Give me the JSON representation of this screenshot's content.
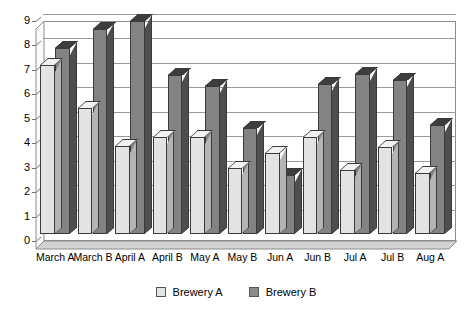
{
  "chart_data": {
    "type": "bar",
    "title": "",
    "subtitle": "",
    "xlabel": "",
    "ylabel": "",
    "ylim": [
      0,
      9
    ],
    "yticks": [
      0,
      1,
      2,
      3,
      4,
      5,
      6,
      7,
      8,
      9
    ],
    "grid": true,
    "legend_position": "bottom",
    "style": "3d-grouped-column",
    "categories": [
      "March A",
      "March B",
      "April A",
      "April B",
      "May A",
      "May B",
      "Jun A",
      "Jun B",
      "Jul A",
      "Jul B",
      "Aug A"
    ],
    "series": [
      {
        "name": "Brewery A",
        "color": "#e3e3e3",
        "values": [
          6.9,
          5.15,
          3.6,
          3.95,
          3.95,
          2.7,
          3.3,
          3.95,
          2.6,
          3.55,
          2.5
        ]
      },
      {
        "name": "Brewery B",
        "color": "#838383",
        "values": [
          7.6,
          8.4,
          8.7,
          6.5,
          6.05,
          4.35,
          2.4,
          6.15,
          6.55,
          6.3,
          4.45
        ]
      }
    ]
  },
  "legend": {
    "items": [
      {
        "label": "Brewery A",
        "swatch": "light-swatch-icon"
      },
      {
        "label": "Brewery B",
        "swatch": "dark-swatch-icon"
      }
    ]
  }
}
